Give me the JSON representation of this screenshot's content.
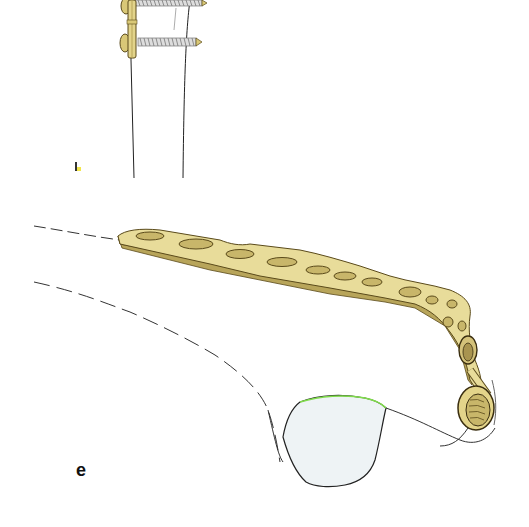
{
  "figure": {
    "type": "surgical illustration",
    "panel_label": "e",
    "subjects": [
      "bone plate with screws (upper view)",
      "anatomically contoured locking bone plate on bone (lower view)"
    ],
    "colors": {
      "background": "#ffffff",
      "plate_fill": "#e8dc9a",
      "plate_shadow": "#b8a55a",
      "plate_outline": "#5a4a1a",
      "bone_outline": "#222222",
      "cavity_fill": "#eef3f5",
      "screw_thread": "#8a8a7a"
    }
  }
}
